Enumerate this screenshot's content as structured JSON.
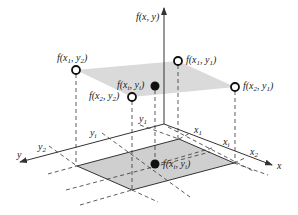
{
  "axes": {
    "z_label": "f(x, y)",
    "x_label": "x",
    "y_label": "y"
  },
  "x_ticks": [
    {
      "base": "x",
      "sub": "1"
    },
    {
      "base": "x",
      "sub": "i"
    },
    {
      "base": "x",
      "sub": "2"
    }
  ],
  "y_ticks": [
    {
      "base": "y",
      "sub": "1"
    },
    {
      "base": "y",
      "sub": "i"
    },
    {
      "base": "y",
      "sub": "2"
    }
  ],
  "points": {
    "f_x1_y2": {
      "text": "f(x",
      "a": "1",
      "mid": ", y",
      "b": "2",
      "end": ")"
    },
    "f_x1_y1": {
      "text": "f(x",
      "a": "1",
      "mid": ", y",
      "b": "1",
      "end": ")"
    },
    "f_x2_y1": {
      "text": "f(x",
      "a": "2",
      "mid": ", y",
      "b": "1",
      "end": ")"
    },
    "f_x2_y2": {
      "text": "f(x",
      "a": "2",
      "mid": ", y",
      "b": "2",
      "end": ")"
    },
    "f_xi_yi_top": {
      "text": "f(x",
      "a": "i",
      "mid": ", y",
      "b": "i",
      "end": ")"
    },
    "f_xi_yi_base": {
      "text": "f(x",
      "a": "i",
      "mid": ", y",
      "b": "i",
      "end": ")"
    }
  },
  "colors": {
    "plane_fill": "#d9d9d9",
    "base_fill": "#cfcfcf",
    "line": "#333333"
  }
}
